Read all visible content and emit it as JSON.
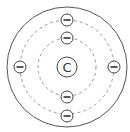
{
  "diagram": {
    "nucleus": {
      "label": "C",
      "cx": 67,
      "cy": 67,
      "r": 10
    },
    "outer_boundary": {
      "cx": 67,
      "cy": 67,
      "r": 60,
      "stroke": "#555555"
    },
    "orbits": [
      {
        "name": "inner-shell",
        "r": 29,
        "stroke": "#999999",
        "dash": "3,3"
      },
      {
        "name": "outer-shell",
        "r": 47,
        "stroke": "#999999",
        "dash": "3,3"
      }
    ],
    "electrons": [
      {
        "shell": 1,
        "cx": 67,
        "cy": 38,
        "symbol": "−"
      },
      {
        "shell": 1,
        "cx": 67,
        "cy": 97,
        "symbol": "−"
      },
      {
        "shell": 2,
        "cx": 67,
        "cy": 20,
        "symbol": "−"
      },
      {
        "shell": 2,
        "cx": 67,
        "cy": 116,
        "symbol": "−"
      },
      {
        "shell": 2,
        "cx": 20,
        "cy": 67,
        "symbol": "−"
      },
      {
        "shell": 2,
        "cx": 114,
        "cy": 67,
        "symbol": "−"
      }
    ],
    "electron_radius": 6,
    "line_color": "#444444"
  }
}
